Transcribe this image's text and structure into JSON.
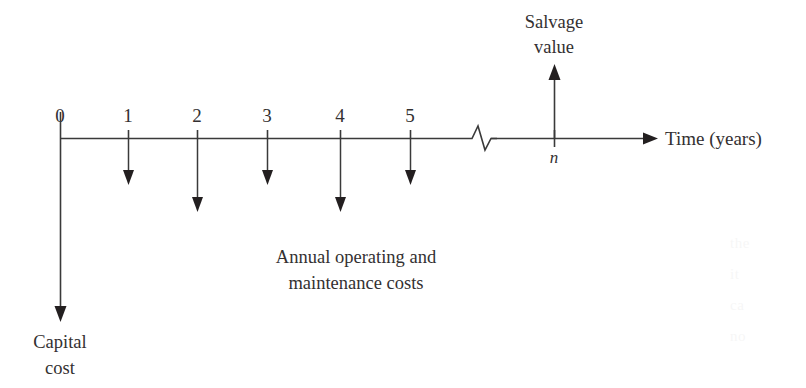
{
  "figure": {
    "kind": "cash-flow-diagram",
    "background_color": "#ffffff",
    "ink_color": "#231f20",
    "line_color": "#3a3a3a"
  },
  "axis": {
    "caption": "Time (years)",
    "origin_tick_label": "0",
    "end_tick_label": "n",
    "break_symbol": "zigzag-break",
    "tick_labels": [
      "0",
      "1",
      "2",
      "3",
      "4",
      "5"
    ]
  },
  "inflow": {
    "label_line1": "Salvage",
    "label_line2": "value",
    "direction": "up",
    "at_period": "n"
  },
  "capital": {
    "label_line1": "Capital",
    "label_line2": "cost",
    "direction": "down",
    "at_period": "0"
  },
  "operating": {
    "label_line1": "Annual operating and",
    "label_line2": "maintenance costs",
    "direction": "down",
    "at_periods": [
      "1",
      "2",
      "3",
      "4",
      "5"
    ]
  },
  "ghost_marks": {
    "l1": "the",
    "l2": "it",
    "l3": "ca",
    "l4": "no"
  }
}
